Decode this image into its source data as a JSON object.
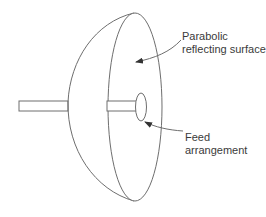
{
  "diagram": {
    "type": "parabolic-antenna-schematic",
    "colors": {
      "line": "#6e6e6e",
      "text": "#3a3a3a",
      "background": "#ffffff"
    },
    "labels": {
      "reflector": {
        "line1": "Parabolic",
        "line2": "reflecting surface"
      },
      "feed": {
        "line1": "Feed",
        "line2": "arrangement"
      }
    },
    "components": [
      {
        "name": "parabolic-reflecting-surface",
        "label": "Parabolic reflecting surface"
      },
      {
        "name": "feed-arrangement",
        "label": "Feed arrangement"
      },
      {
        "name": "rear-support-shaft"
      },
      {
        "name": "feed-support-shaft"
      }
    ]
  }
}
